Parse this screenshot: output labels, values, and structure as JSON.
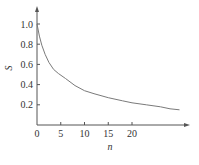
{
  "chart_data": {
    "type": "line",
    "title": "",
    "xlabel": "n",
    "ylabel": "S",
    "xlim": [
      0,
      32
    ],
    "ylim": [
      0,
      1.1
    ],
    "x_ticks": [
      0,
      5,
      10,
      15,
      20
    ],
    "x_tick_labels": [
      "0",
      "5",
      "10",
      "15",
      "20"
    ],
    "y_ticks": [
      0.2,
      0.4,
      0.6,
      0.8,
      1.0
    ],
    "y_tick_labels": [
      "0.2",
      "0.4",
      "0.6",
      "0.8",
      "1.0"
    ],
    "grid": false,
    "series": [
      {
        "name": "S",
        "color": "#7a7a7a",
        "x": [
          0,
          0.5,
          1,
          1.7,
          2.5,
          3.5,
          4.5,
          6,
          8,
          10,
          12,
          15,
          18,
          20,
          23,
          26,
          28,
          30
        ],
        "y": [
          1.0,
          0.88,
          0.79,
          0.7,
          0.62,
          0.55,
          0.51,
          0.46,
          0.39,
          0.34,
          0.31,
          0.27,
          0.24,
          0.22,
          0.2,
          0.18,
          0.16,
          0.15
        ]
      }
    ]
  }
}
